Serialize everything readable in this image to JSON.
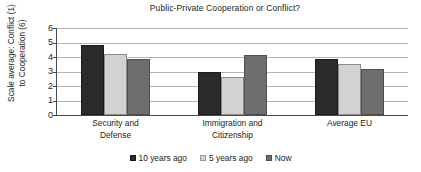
{
  "chart_data": {
    "type": "bar",
    "title": "Public-Private Cooperation or Conflict?",
    "xlabel": "",
    "ylabel": "Scale average: Conflict (1) to Cooperation (6)",
    "ylim": [
      0,
      6
    ],
    "ytick_labels": [
      "6",
      "5",
      "4",
      "3",
      "2",
      "1",
      "0"
    ],
    "ytick_values": [
      6,
      5,
      4,
      3,
      2,
      1,
      0
    ],
    "grid": true,
    "legend_position": "bottom",
    "categories": [
      "Security and Defense",
      "Immigration and Citizenship",
      "Average EU"
    ],
    "categories_lines": [
      [
        "Security and",
        "Defense"
      ],
      [
        "Immigration and",
        "Citizenship"
      ],
      [
        "Average EU",
        ""
      ]
    ],
    "series": [
      {
        "name": "10 years ago",
        "color": "#2b2b2b",
        "values": [
          4.8,
          3.0,
          3.85
        ]
      },
      {
        "name": "5 years ago",
        "color": "#d2d2d2",
        "values": [
          4.2,
          2.65,
          3.55
        ]
      },
      {
        "name": "Now",
        "color": "#6e6e6e",
        "values": [
          3.85,
          4.15,
          3.2
        ]
      }
    ]
  }
}
